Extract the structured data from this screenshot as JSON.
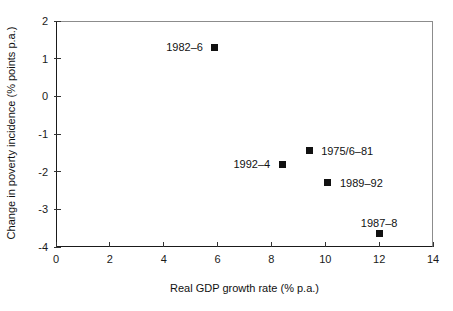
{
  "chart_data": {
    "type": "scatter",
    "title": "",
    "xlabel": "Real GDP growth rate (% p.a.)",
    "ylabel": "Change in poverty incidence (% points p.a.)",
    "xlim": [
      0,
      14
    ],
    "ylim": [
      -4,
      2
    ],
    "xticks": [
      "0",
      "2",
      "4",
      "6",
      "8",
      "10",
      "12",
      "14"
    ],
    "yticks": [
      "2",
      "1",
      "0",
      "-1",
      "-2",
      "-3",
      "-4"
    ],
    "grid": false,
    "legend": "none",
    "marker": {
      "shape": "square",
      "color": "#111111",
      "size": 7
    },
    "points": [
      {
        "label": "1982–6",
        "x": 5.9,
        "y": 1.3,
        "label_side": "left"
      },
      {
        "label": "1975/6–81",
        "x": 9.4,
        "y": -1.45,
        "label_side": "right"
      },
      {
        "label": "1992–4",
        "x": 8.4,
        "y": -1.8,
        "label_side": "left"
      },
      {
        "label": "1989–92",
        "x": 10.1,
        "y": -2.3,
        "label_side": "right"
      },
      {
        "label": "1987–8",
        "x": 12.0,
        "y": -3.65,
        "label_side": "above"
      }
    ]
  },
  "colors": {
    "axis": "#1a1a1a",
    "frame": "#8c8c8c",
    "marker": "#111111",
    "text": "#111111"
  }
}
